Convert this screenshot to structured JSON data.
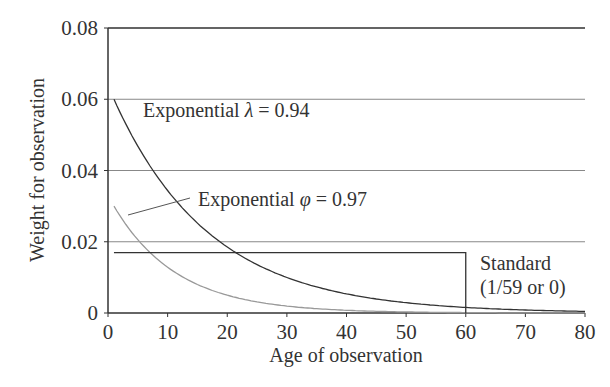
{
  "chart_data": {
    "type": "line",
    "title": "",
    "xlabel": "Age of observation",
    "ylabel": "Weight for observation",
    "xlim": [
      0,
      80
    ],
    "ylim": [
      0,
      0.08
    ],
    "xticks": [
      "0",
      "10",
      "20",
      "30",
      "40",
      "50",
      "60",
      "70",
      "80"
    ],
    "yticks": [
      "0",
      "0.02",
      "0.04",
      "0.06",
      "0.08"
    ],
    "grid": "horizontal",
    "series": [
      {
        "name": "Exponential λ = 0.94",
        "formula": "0.06 * 0.94^(age-1)",
        "x": [
          1,
          5,
          10,
          15,
          20,
          25,
          30,
          40,
          50,
          60,
          70,
          80
        ],
        "values": [
          0.06,
          0.0468,
          0.0345,
          0.0254,
          0.0186,
          0.0137,
          0.0101,
          0.0054,
          0.0029,
          0.0016,
          0.0008,
          0.0005
        ],
        "color": "#333333"
      },
      {
        "name": "Exponential φ = 0.97",
        "formula": "0.03 * 0.97^(age-1)... approx",
        "x": [
          1,
          5,
          10,
          15,
          20,
          25,
          30,
          40,
          50,
          60,
          70,
          80
        ],
        "values": [
          0.03,
          0.0196,
          0.0125,
          0.0085,
          0.0058,
          0.004,
          0.0027,
          0.0013,
          0.0006,
          0.0003,
          0.0001,
          0.0001
        ],
        "color": "#999999"
      },
      {
        "name": "Standard (1/59 or 0)",
        "x": [
          1,
          60,
          60,
          80
        ],
        "values": [
          0.01695,
          0.01695,
          0,
          0
        ],
        "color": "#333333"
      }
    ],
    "annotations": [
      {
        "text": "Exponential λ = 0.94",
        "x": 8,
        "y": 0.047
      },
      {
        "text": "Exponential φ = 0.97",
        "x": 20,
        "y": 0.033
      },
      {
        "text": "Standard",
        "x": 62,
        "y": 0.017
      },
      {
        "text": "(1/59 or 0)",
        "x": 62,
        "y": 0.009
      }
    ]
  },
  "labels": {
    "xlabel": "Age of observation",
    "ylabel": "Weight for observation",
    "ann_lambda_prefix": "Exponential ",
    "ann_lambda_sym": "λ",
    "ann_lambda_val": " = 0.94",
    "ann_phi_prefix": "Exponential ",
    "ann_phi_sym": "φ",
    "ann_phi_val": " = 0.97",
    "ann_std_1": "Standard",
    "ann_std_2": "(1/59 or 0)"
  },
  "ticks": {
    "x": [
      "0",
      "10",
      "20",
      "30",
      "40",
      "50",
      "60",
      "70",
      "80"
    ],
    "y": [
      "0",
      "0.02",
      "0.04",
      "0.06",
      "0.08"
    ]
  }
}
